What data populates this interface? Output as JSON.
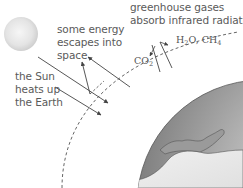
{
  "diagram": {
    "labels": {
      "sun": [
        "the Sun",
        "heats up",
        "the Earth"
      ],
      "escape": [
        "some energy",
        "escapes into",
        "space"
      ],
      "greenhouse": [
        "greenhouse gases",
        "absorb infrared radiation"
      ]
    },
    "gases": {
      "co2": {
        "base": "CO",
        "sub": "2"
      },
      "h2o": {
        "base": "H",
        "sub": "2",
        "rest": "O, CH",
        "sub2": "4"
      }
    },
    "icons": {
      "sun": "sun-icon",
      "earth": "earth-globe-icon",
      "atmosphere": "atmosphere-dashed-arc"
    },
    "colors": {
      "sun": "#e6e6e6",
      "earth_dark": "#8c8c8c",
      "earth_light": "#d8d8d8",
      "land": "#a8a8a8",
      "arrow": "#444444",
      "text": "#5a5a5a"
    }
  }
}
